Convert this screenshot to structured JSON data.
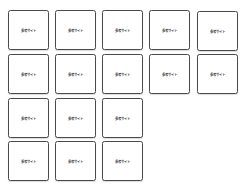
{
  "cards": [
    {
      "label": "参考サイト",
      "col": 0,
      "row": 0
    },
    {
      "label": "参考サイト",
      "col": 1,
      "row": 0
    },
    {
      "label": "参考サイト",
      "col": 2,
      "row": 0
    },
    {
      "label": "参考サイト",
      "col": 3,
      "row": 0
    },
    {
      "label": "参考サイト",
      "col": 4,
      "row": 0
    },
    {
      "label": "参考サイト",
      "col": 0,
      "row": 1
    },
    {
      "label": "参考サイト",
      "col": 1,
      "row": 1
    },
    {
      "label": "参考サイト",
      "col": 2,
      "row": 1
    },
    {
      "label": "参考サイト",
      "col": 3,
      "row": 1
    },
    {
      "label": "参考サイト",
      "col": 4,
      "row": 1
    },
    {
      "label": "参考サイト",
      "col": 0,
      "row": 2
    },
    {
      "label": "参考サイト",
      "col": 1,
      "row": 2
    },
    {
      "label": "参考サイト",
      "col": 2,
      "row": 2
    },
    {
      "label": "参考サイト",
      "col": 0,
      "row": 3
    },
    {
      "label": "参考サイト",
      "col": 1,
      "row": 3
    },
    {
      "label": "参考サイト",
      "col": 2,
      "row": 3
    }
  ]
}
